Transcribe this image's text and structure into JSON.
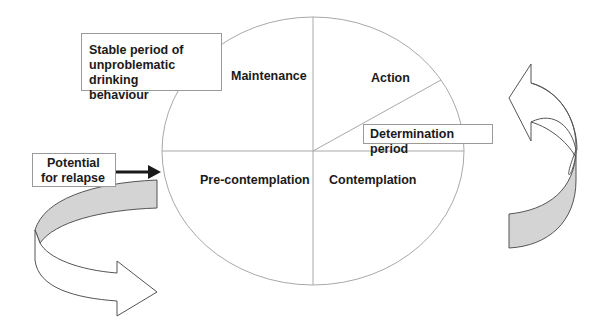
{
  "diagram": {
    "type": "cycle-of-change",
    "segments": [
      {
        "id": "maintenance",
        "label": "Maintenance"
      },
      {
        "id": "action",
        "label": "Action"
      },
      {
        "id": "precontemplation",
        "label": "Pre-contemplation"
      },
      {
        "id": "contemplation",
        "label": "Contemplation"
      }
    ],
    "annotations": {
      "stable": {
        "lines": [
          "Stable period of",
          "unproblematic drinking",
          "behaviour"
        ]
      },
      "determination": {
        "lines": [
          "Determination period"
        ]
      },
      "relapse": {
        "lines": [
          "Potential",
          "for relapse"
        ]
      }
    },
    "arrows": {
      "relapse_pointer": "right-arrow",
      "left_cycle": "curved-arrow-right",
      "right_cycle": "curved-arrow-left"
    },
    "colors": {
      "line": "#a8a8a8",
      "outline": "#555555",
      "band_fill": "#d4d4d4",
      "text": "#1a1a1a"
    }
  }
}
